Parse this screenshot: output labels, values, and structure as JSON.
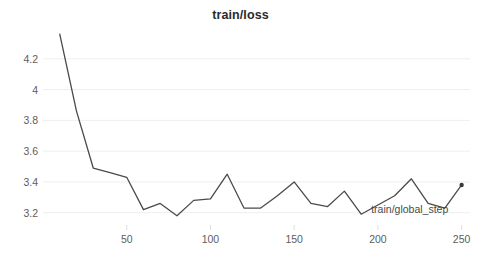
{
  "chart_data": {
    "type": "line",
    "title": "train/loss",
    "xlabel": "train/global_step",
    "ylabel": "",
    "legend": [],
    "legend_position": "none",
    "grid": true,
    "grid_axis": "y",
    "xlim": [
      0,
      255
    ],
    "ylim": [
      3.12,
      4.4
    ],
    "xticks": [
      50,
      100,
      150,
      200,
      250
    ],
    "xtick_labels": [
      "50",
      "100",
      "150",
      "200",
      "250"
    ],
    "yticks": [
      3.2,
      3.4,
      3.6,
      3.8,
      4.0,
      4.2
    ],
    "ytick_labels": [
      "3.2",
      "3.4",
      "3.6",
      "3.8",
      "4",
      "4.2"
    ],
    "line_color": "#4a4a4a",
    "line_width": 1.3,
    "marker_last_point": true,
    "x": [
      10,
      20,
      30,
      40,
      50,
      60,
      70,
      80,
      90,
      100,
      110,
      120,
      130,
      140,
      150,
      160,
      170,
      180,
      190,
      200,
      210,
      220,
      230,
      240,
      250
    ],
    "values": [
      4.36,
      3.86,
      3.49,
      3.46,
      3.43,
      3.22,
      3.26,
      3.18,
      3.28,
      3.29,
      3.45,
      3.23,
      3.23,
      3.31,
      3.4,
      3.26,
      3.24,
      3.34,
      3.19,
      3.25,
      3.31,
      3.42,
      3.26,
      3.23,
      3.38
    ],
    "series": [
      {
        "name": "train/loss",
        "values": [
          4.36,
          3.86,
          3.49,
          3.46,
          3.43,
          3.22,
          3.26,
          3.18,
          3.28,
          3.29,
          3.45,
          3.23,
          3.23,
          3.31,
          3.4,
          3.26,
          3.24,
          3.34,
          3.19,
          3.25,
          3.31,
          3.42,
          3.26,
          3.23,
          3.38
        ]
      }
    ]
  },
  "colors": {
    "line": "#4a4a4a",
    "grid": "#eeeeee",
    "tick_text": "#5d5d5d",
    "title_text": "#2b2b2b",
    "background": "#ffffff"
  }
}
